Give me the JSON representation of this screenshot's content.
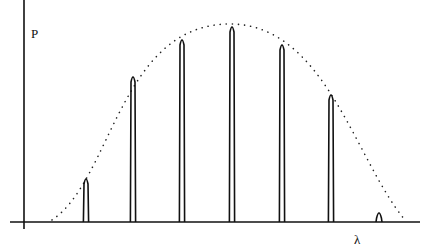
{
  "chart_data": {
    "type": "line",
    "title": "",
    "xlabel": "λ",
    "ylabel": "P",
    "grid": false,
    "legend": null,
    "axes": {
      "origin_px": [
        24,
        222
      ],
      "x_axis_px": [
        10,
        420
      ],
      "y_axis_px": [
        0,
        228
      ]
    },
    "peaks": [
      {
        "x_px": 86,
        "top_px": 176,
        "relative_height": 0.23
      },
      {
        "x_px": 133,
        "top_px": 74,
        "relative_height": 0.75
      },
      {
        "x_px": 182,
        "top_px": 37,
        "relative_height": 0.93
      },
      {
        "x_px": 232,
        "top_px": 24,
        "relative_height": 1.0
      },
      {
        "x_px": 282,
        "top_px": 42,
        "relative_height": 0.91
      },
      {
        "x_px": 331,
        "top_px": 92,
        "relative_height": 0.66
      },
      {
        "x_px": 379,
        "top_px": 210,
        "relative_height": 0.06
      }
    ],
    "envelope": {
      "style": "dotted",
      "start_px": [
        52,
        220
      ],
      "apex_px": [
        230,
        24
      ],
      "end_px": [
        405,
        220
      ]
    }
  },
  "labels": {
    "y_axis": "P",
    "x_axis": "λ"
  },
  "colors": {
    "lines": "#111111",
    "envelope": "#222222",
    "background": "#ffffff"
  }
}
